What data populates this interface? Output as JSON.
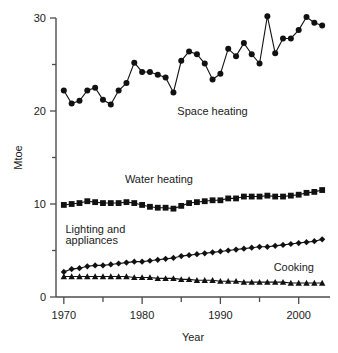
{
  "chart_data": {
    "type": "line",
    "title": "",
    "xlabel": "Year",
    "ylabel": "Mtoe",
    "xlim": [
      1969,
      2004
    ],
    "ylim": [
      0,
      30
    ],
    "grid": false,
    "legend_position": "inline-annotations",
    "x_major_ticks": [
      1970,
      1980,
      1990,
      2000
    ],
    "x_minor_ticks": [
      1975,
      1985,
      1995
    ],
    "y_major_ticks": [
      0,
      10,
      20,
      30
    ],
    "y_minor_ticks": [
      5,
      15,
      25
    ],
    "x": [
      1970,
      1971,
      1972,
      1973,
      1974,
      1975,
      1976,
      1977,
      1978,
      1979,
      1980,
      1981,
      1982,
      1983,
      1984,
      1985,
      1986,
      1987,
      1988,
      1989,
      1990,
      1991,
      1992,
      1993,
      1994,
      1995,
      1996,
      1997,
      1998,
      1999,
      2000,
      2001,
      2002,
      2003
    ],
    "series": [
      {
        "name": "Space heating",
        "marker": "circle",
        "values": [
          22.2,
          20.8,
          21.1,
          22.2,
          22.5,
          21.2,
          20.7,
          22.2,
          23.0,
          25.2,
          24.2,
          24.2,
          23.9,
          23.6,
          22.0,
          25.4,
          26.4,
          26.1,
          25.1,
          23.4,
          24.0,
          26.7,
          25.9,
          27.3,
          26.1,
          25.1,
          30.2,
          26.2,
          27.8,
          27.8,
          28.7,
          30.1,
          29.5,
          29.2
        ]
      },
      {
        "name": "Water heating",
        "marker": "square",
        "values": [
          9.9,
          10.0,
          10.1,
          10.3,
          10.2,
          10.1,
          10.1,
          10.1,
          10.2,
          10.1,
          9.9,
          9.7,
          9.6,
          9.6,
          9.5,
          9.8,
          10.1,
          10.2,
          10.3,
          10.4,
          10.4,
          10.6,
          10.6,
          10.8,
          10.8,
          10.8,
          10.9,
          10.8,
          10.8,
          10.9,
          11.0,
          11.2,
          11.3,
          11.5
        ]
      },
      {
        "name": "Lighting and appliances",
        "marker": "diamond",
        "values": [
          2.7,
          3.0,
          3.1,
          3.3,
          3.4,
          3.4,
          3.5,
          3.6,
          3.7,
          3.8,
          3.8,
          3.9,
          4.0,
          4.1,
          4.2,
          4.4,
          4.5,
          4.6,
          4.7,
          4.8,
          4.9,
          5.0,
          5.1,
          5.2,
          5.3,
          5.4,
          5.4,
          5.5,
          5.6,
          5.7,
          5.8,
          5.9,
          6.0,
          6.2
        ]
      },
      {
        "name": "Cooking",
        "marker": "triangle",
        "values": [
          2.2,
          2.2,
          2.2,
          2.2,
          2.2,
          2.2,
          2.2,
          2.2,
          2.2,
          2.1,
          2.1,
          2.1,
          2.0,
          2.0,
          2.0,
          1.9,
          1.9,
          1.8,
          1.8,
          1.8,
          1.7,
          1.7,
          1.7,
          1.6,
          1.6,
          1.6,
          1.6,
          1.6,
          1.6,
          1.5,
          1.5,
          1.5,
          1.5,
          1.5
        ]
      }
    ],
    "annotations": [
      {
        "text": "Space heating",
        "x": 1984.5,
        "y": 19.6
      },
      {
        "text": "Water heating",
        "x": 1977.8,
        "y": 12.3
      },
      {
        "text": "Lighting and",
        "x": 1970.2,
        "y": 6.9
      },
      {
        "text": "appliances",
        "x": 1970.2,
        "y": 5.7
      },
      {
        "text": "Cooking",
        "x": 1996.8,
        "y": 2.8
      }
    ],
    "colors": {
      "series": "#111111",
      "axis": "#4d4d4d",
      "background": "#ffffff",
      "text": "#1a1a1a"
    }
  }
}
